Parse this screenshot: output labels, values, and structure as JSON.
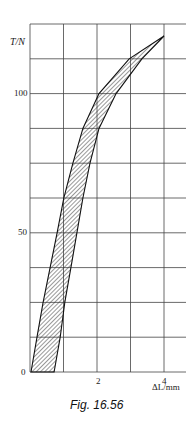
{
  "chart_data": {
    "type": "area",
    "title": "",
    "caption": "Fig. 16.56",
    "xlabel": "ΔL/mm",
    "ylabel": "T/N",
    "xlim": [
      0,
      4
    ],
    "ylim": [
      0,
      125
    ],
    "grid": true,
    "x_gridlines": [
      0,
      1,
      2,
      3,
      4
    ],
    "y_gridlines": [
      0,
      12.5,
      25,
      37.5,
      50,
      62.5,
      75,
      87.5,
      100,
      112.5,
      125
    ],
    "x_tick_labels": [
      {
        "value": 2,
        "label": "2"
      },
      {
        "value": 4,
        "label": "4"
      }
    ],
    "y_tick_labels": [
      {
        "value": 0,
        "label": "0"
      },
      {
        "value": 50,
        "label": "50"
      },
      {
        "value": 100,
        "label": "100"
      }
    ],
    "fill": "hatched (hysteresis loop)",
    "series": [
      {
        "name": "loading (upper/left boundary)",
        "points": [
          [
            0.03,
            0
          ],
          [
            0.21,
            12.5
          ],
          [
            0.39,
            25
          ],
          [
            0.6,
            37.5
          ],
          [
            0.81,
            50
          ],
          [
            1.01,
            62.5
          ],
          [
            1.28,
            75
          ],
          [
            1.58,
            87.5
          ],
          [
            2.06,
            100
          ],
          [
            2.96,
            112.5
          ],
          [
            4.0,
            120.7
          ]
        ]
      },
      {
        "name": "unloading (lower/right boundary)",
        "points": [
          [
            0.72,
            0
          ],
          [
            0.9,
            12.5
          ],
          [
            1.04,
            25
          ],
          [
            1.22,
            37.5
          ],
          [
            1.4,
            50
          ],
          [
            1.58,
            62.5
          ],
          [
            1.79,
            75
          ],
          [
            2.06,
            87.5
          ],
          [
            2.57,
            100
          ],
          [
            3.34,
            112.5
          ],
          [
            4.0,
            120.7
          ]
        ]
      }
    ]
  },
  "labels": {
    "y_axis": "T/N",
    "x_axis": "ΔL/mm",
    "y100": "100",
    "y50": "50",
    "y0": "0",
    "x2": "2",
    "x4": "4",
    "caption": "Fig. 16.56"
  }
}
